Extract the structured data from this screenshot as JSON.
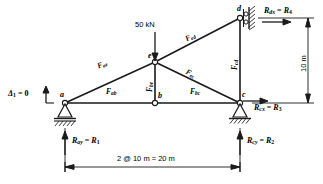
{
  "figure": {
    "type": "truss-free-body-diagram",
    "geometry": {
      "joints": [
        {
          "id": "a",
          "label": "a",
          "x": 65,
          "y": 103
        },
        {
          "id": "b",
          "label": "b",
          "x": 155,
          "y": 103
        },
        {
          "id": "c",
          "label": "c",
          "x": 240,
          "y": 103
        },
        {
          "id": "e",
          "label": "e",
          "x": 155,
          "y": 62
        },
        {
          "id": "d",
          "label": "d",
          "x": 240,
          "y": 18
        }
      ],
      "members": [
        {
          "from": "a",
          "to": "b",
          "force_label": "F_ab"
        },
        {
          "from": "b",
          "to": "c",
          "force_label": "F_bc"
        },
        {
          "from": "a",
          "to": "e",
          "force_label": "F_ae"
        },
        {
          "from": "b",
          "to": "e",
          "force_label": "F_be"
        },
        {
          "from": "e",
          "to": "c",
          "force_label": "F_ec"
        },
        {
          "from": "e",
          "to": "d",
          "force_label": "F_ed"
        },
        {
          "from": "c",
          "to": "d",
          "force_label": "F_cd"
        }
      ]
    },
    "member_forces": [
      {
        "name": "F",
        "sub": "ab",
        "x": 108,
        "y": 92,
        "rot": 0
      },
      {
        "name": "F",
        "sub": "bc",
        "x": 193,
        "y": 92,
        "rot": 0
      },
      {
        "name": "F",
        "sub": "ae",
        "x": 100,
        "y": 69,
        "rot": -24
      },
      {
        "name": "F",
        "sub": "be",
        "x": 143,
        "y": 80,
        "rot": -90
      },
      {
        "name": "F",
        "sub": "ec",
        "x": 195,
        "y": 73,
        "rot": 27
      },
      {
        "name": "F",
        "sub": "ed",
        "x": 190,
        "y": 36,
        "rot": -27
      },
      {
        "name": "F",
        "sub": "cd",
        "x": 232,
        "y": 58,
        "rot": -90
      }
    ],
    "load": {
      "label": "50 kN",
      "x": 135,
      "y": 23,
      "arrow_x": 155,
      "arrow_top": 32,
      "arrow_bottom": 60
    },
    "reactions": [
      {
        "id": "Ray",
        "text_main": "R",
        "sub": "ay",
        "eq": " = ",
        "text_r": "R",
        "r_sub": "1",
        "x": 72,
        "y": 140
      },
      {
        "id": "Rcy",
        "text_main": "R",
        "sub": "cy",
        "eq": " = ",
        "text_r": "R",
        "r_sub": "2",
        "x": 247,
        "y": 140
      },
      {
        "id": "Rcx",
        "text_main": "R",
        "sub": "cx",
        "eq": " = ",
        "text_r": "R",
        "r_sub": "3",
        "x": 255,
        "y": 107
      },
      {
        "id": "Rdx",
        "text_main": "R",
        "sub": "dx",
        "eq": " = ",
        "text_r": "R",
        "r_sub": "4",
        "x": 265,
        "y": 7
      }
    ],
    "displacement": {
      "symbol": "Δ",
      "sub": "1",
      "eq": " = 0",
      "x": 8,
      "y": 90
    },
    "dimensions": [
      {
        "id": "span",
        "label": "2 @ 10 m = 20 m",
        "x": 117,
        "y": 160,
        "orientation": "horizontal"
      },
      {
        "id": "height",
        "label": "10 m",
        "x": 300,
        "y": 72,
        "orientation": "vertical"
      }
    ],
    "supports": [
      {
        "id": "support-a",
        "type": "pin-hatched",
        "x": 65,
        "y": 103
      },
      {
        "id": "support-c",
        "type": "pin-hatched",
        "x": 240,
        "y": 103
      },
      {
        "id": "support-d",
        "type": "roller-wall",
        "x": 240,
        "y": 18
      }
    ],
    "colors": {
      "line": "#1a1a1a",
      "background": "#ffffff"
    }
  }
}
